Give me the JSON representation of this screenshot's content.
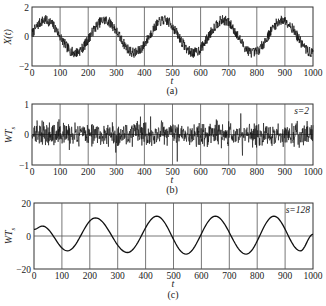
{
  "chart_data": [
    {
      "id": "a",
      "type": "line",
      "caption": "(a)",
      "title": "",
      "xlabel": "t",
      "ylabel": "X(t)",
      "xlim": [
        0,
        1000
      ],
      "ylim": [
        -2,
        2
      ],
      "xticks": [
        0,
        100,
        200,
        300,
        400,
        500,
        600,
        700,
        800,
        900,
        1000
      ],
      "yticks": [
        -2,
        0,
        2
      ],
      "grid": true,
      "annotation": "",
      "description": "Noisy sinusoid: amplitude ~1.1, period ~212 samples, plus high-frequency noise ~±0.3",
      "series": [
        {
          "name": "X(t)",
          "x": [
            0,
            50,
            100,
            160,
            210,
            265,
            320,
            375,
            430,
            475,
            530,
            580,
            640,
            690,
            745,
            800,
            850,
            895,
            950,
            1000
          ],
          "y": [
            0.1,
            1.2,
            0.2,
            -1.2,
            -0.1,
            1.3,
            0.2,
            -1.1,
            0.3,
            1.3,
            0.1,
            -1.2,
            0.1,
            1.2,
            0.3,
            -1.1,
            0.0,
            1.4,
            0.1,
            -1.2
          ]
        }
      ],
      "signal": {
        "kind": "noisy_sine",
        "amp": 1.1,
        "period": 211,
        "phase": 0.15,
        "noise": 0.35,
        "seed": 7
      }
    },
    {
      "id": "b",
      "type": "line",
      "caption": "(b)",
      "title": "",
      "xlabel": "t",
      "ylabel": "WT_s",
      "xlim": [
        0,
        1000
      ],
      "ylim": [
        -1,
        1
      ],
      "xticks": [
        0,
        100,
        200,
        300,
        400,
        500,
        600,
        700,
        800,
        900,
        1000
      ],
      "yticks": [
        -1,
        0,
        1
      ],
      "grid": true,
      "annotation": "s=2",
      "description": "Wavelet coefficients at scale 2: zero-mean high-frequency noise, mostly within ±0.5, spikes to ~±0.7",
      "series": [
        {
          "name": "WT_s (s=2)",
          "x": [
            0,
            1000
          ],
          "y_range": [
            -0.75,
            0.75
          ]
        }
      ],
      "signal": {
        "kind": "noise",
        "amp": 0.28,
        "seed": 13
      }
    },
    {
      "id": "c",
      "type": "line",
      "caption": "(c)",
      "title": "",
      "xlabel": "t",
      "ylabel": "WT_s",
      "xlim": [
        0,
        1000
      ],
      "ylim": [
        -20,
        20
      ],
      "xticks": [
        0,
        100,
        200,
        300,
        400,
        500,
        600,
        700,
        800,
        900,
        1000
      ],
      "yticks": [
        -20,
        0,
        20
      ],
      "grid": true,
      "annotation": "s=128",
      "description": "Wavelet coefficients at scale 128: smooth sinusoid, amplitude ~11 (smaller ~6 at start), period ~212",
      "series": [
        {
          "name": "WT_s (s=128)",
          "x": [
            0,
            30,
            120,
            220,
            335,
            440,
            545,
            650,
            760,
            860,
            955,
            1000
          ],
          "y": [
            4,
            6,
            -9,
            11,
            -10,
            12,
            -11,
            12,
            -11,
            12,
            -9,
            1
          ]
        }
      ],
      "signal": {
        "kind": "smooth",
        "points": [
          [
            0,
            4
          ],
          [
            30,
            6
          ],
          [
            120,
            -9
          ],
          [
            220,
            11
          ],
          [
            335,
            -10
          ],
          [
            440,
            12
          ],
          [
            545,
            -11
          ],
          [
            650,
            12
          ],
          [
            760,
            -11
          ],
          [
            860,
            12
          ],
          [
            955,
            -9
          ],
          [
            1000,
            1
          ]
        ]
      }
    }
  ],
  "panels": {
    "a": {
      "caption": "(a)",
      "xlabel": "t",
      "ylabel": "X(t)",
      "annotation": ""
    },
    "b": {
      "caption": "(b)",
      "xlabel": "t",
      "ylabel": "WT",
      "ylabel_sub": "s",
      "annotation": "s=2"
    },
    "c": {
      "caption": "(c)",
      "xlabel": "t",
      "ylabel": "WT",
      "ylabel_sub": "s",
      "annotation": "s=128"
    }
  }
}
